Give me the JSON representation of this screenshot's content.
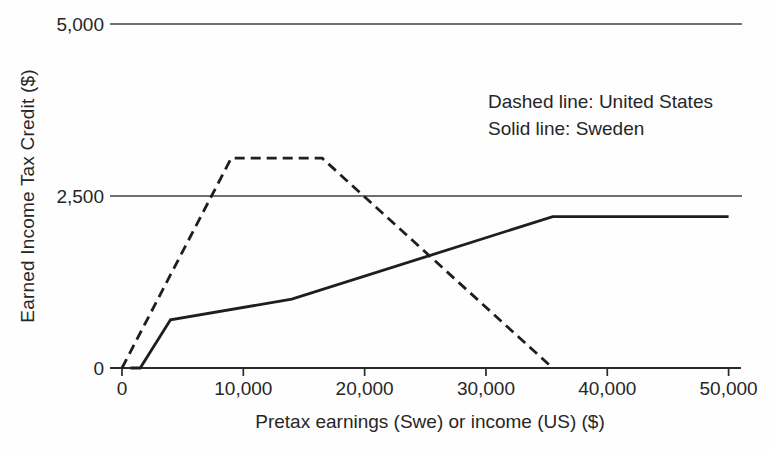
{
  "figure": {
    "background": "#fefefe",
    "line_color": "#1e1e1e",
    "grid_color": "#404040",
    "axis_color": "#2a2a2a",
    "text_color": "#262626"
  },
  "chart_data": {
    "type": "line",
    "title": "",
    "xlabel": "Pretax earnings (Swe) or income (US) ($)",
    "ylabel": "Earned Income Tax Credit ($)",
    "xlim": [
      0,
      50000
    ],
    "ylim": [
      0,
      5000
    ],
    "x_ticks": [
      0,
      10000,
      20000,
      30000,
      40000,
      50000
    ],
    "x_tick_labels": [
      "0",
      "10,000",
      "20,000",
      "30,000",
      "40,000",
      "50,000"
    ],
    "y_ticks": [
      0,
      2500,
      5000
    ],
    "y_tick_labels": [
      "0",
      "2,500",
      "5,000"
    ],
    "gridline_values": [
      2500,
      5000
    ],
    "grid": "horizontal gridlines at 2,500 and 5,000 only",
    "legend_position": "upper-right text annotation (no box)",
    "legend": [
      "Dashed line: United States",
      "Solid line: Sweden"
    ],
    "series": [
      {
        "name": "United States",
        "style": "dashed",
        "points": [
          [
            0,
            0
          ],
          [
            9000,
            3050
          ],
          [
            16500,
            3050
          ],
          [
            35500,
            0
          ]
        ]
      },
      {
        "name": "Sweden",
        "style": "solid",
        "points": [
          [
            700,
            0
          ],
          [
            1500,
            0
          ],
          [
            4000,
            700
          ],
          [
            14000,
            1000
          ],
          [
            35500,
            2200
          ],
          [
            50000,
            2200
          ]
        ]
      }
    ]
  }
}
